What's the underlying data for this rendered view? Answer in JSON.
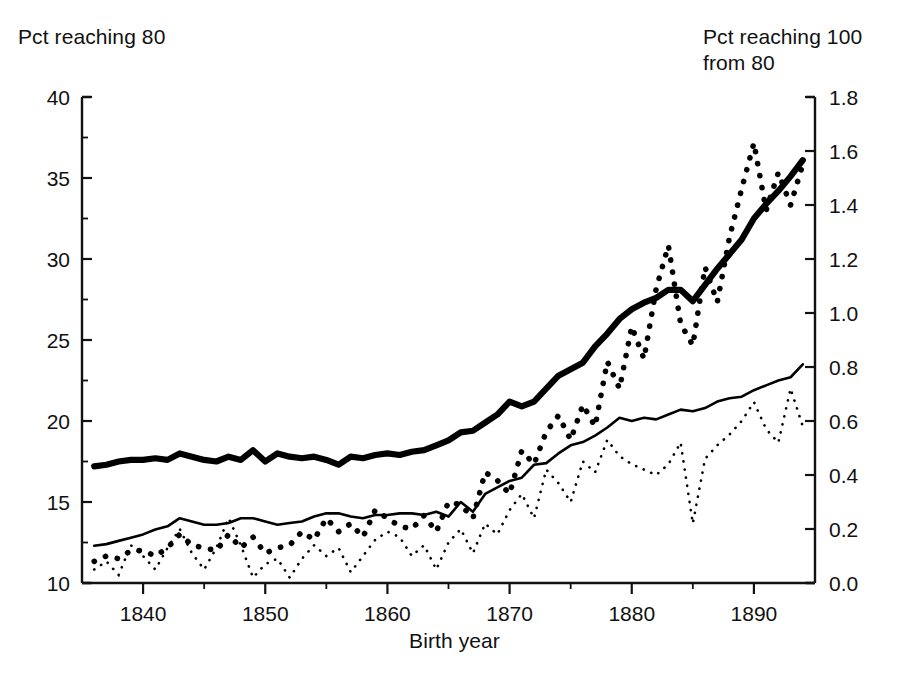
{
  "chart_data": {
    "type": "line",
    "title": "",
    "xlabel": "Birth year",
    "ylabel_left": "Pct reaching 80",
    "ylabel_right": "Pct reaching 100\nfrom 80",
    "grid": false,
    "legend": "none",
    "xlim": [
      1835,
      1895
    ],
    "ylim_left": [
      10,
      40
    ],
    "ylim_right": [
      0.0,
      1.8
    ],
    "xticks": [
      1840,
      1850,
      1860,
      1870,
      1880,
      1890
    ],
    "xticklabels": [
      "1840",
      "1850",
      "1860",
      "1870",
      "1880",
      "1890"
    ],
    "xticks_minor": [
      1845,
      1855,
      1865,
      1875,
      1885
    ],
    "yticks_left": [
      10,
      15,
      20,
      25,
      30,
      35,
      40
    ],
    "yticklabels_left": [
      "10",
      "15",
      "20",
      "25",
      "30",
      "35",
      "40"
    ],
    "yticks_left_minor": [
      12.5,
      17.5,
      22.5,
      27.5,
      32.5,
      37.5
    ],
    "yticks_right": [
      0.0,
      0.2,
      0.4,
      0.6,
      0.8,
      1.0,
      1.2,
      1.4,
      1.6,
      1.8
    ],
    "yticklabels_right": [
      "0.0",
      "0.2",
      "0.4",
      "0.6",
      "0.8",
      "1.0",
      "1.2",
      "1.4",
      "1.6",
      "1.8"
    ],
    "series": [
      {
        "name": "Pct reaching 80, women (thick solid)",
        "style": "thick-solid",
        "axis": "left",
        "x": [
          1836,
          1837,
          1838,
          1839,
          1840,
          1841,
          1842,
          1843,
          1844,
          1845,
          1846,
          1847,
          1848,
          1849,
          1850,
          1851,
          1852,
          1853,
          1854,
          1855,
          1856,
          1857,
          1858,
          1859,
          1860,
          1861,
          1862,
          1863,
          1864,
          1865,
          1866,
          1867,
          1868,
          1869,
          1870,
          1871,
          1872,
          1873,
          1874,
          1875,
          1876,
          1877,
          1878,
          1879,
          1880,
          1881,
          1882,
          1883,
          1884,
          1885,
          1886,
          1887,
          1888,
          1889,
          1890,
          1891,
          1892,
          1893,
          1894
        ],
        "y": [
          17.2,
          17.3,
          17.5,
          17.6,
          17.6,
          17.7,
          17.6,
          18.0,
          17.8,
          17.6,
          17.5,
          17.8,
          17.6,
          18.2,
          17.5,
          18.0,
          17.8,
          17.7,
          17.8,
          17.6,
          17.3,
          17.8,
          17.7,
          17.9,
          18.0,
          17.9,
          18.1,
          18.2,
          18.5,
          18.8,
          19.3,
          19.4,
          19.9,
          20.4,
          21.2,
          20.9,
          21.2,
          22.0,
          22.8,
          23.2,
          23.6,
          24.6,
          25.4,
          26.3,
          26.9,
          27.3,
          27.6,
          28.1,
          28.1,
          27.4,
          28.4,
          29.4,
          30.3,
          31.2,
          32.5,
          33.4,
          34.2,
          35.1,
          36.1
        ]
      },
      {
        "name": "Pct reaching 80, men (thin solid)",
        "style": "thin-solid",
        "axis": "left",
        "x": [
          1836,
          1837,
          1838,
          1839,
          1840,
          1841,
          1842,
          1843,
          1844,
          1845,
          1846,
          1847,
          1848,
          1849,
          1850,
          1851,
          1852,
          1853,
          1854,
          1855,
          1856,
          1857,
          1858,
          1859,
          1860,
          1861,
          1862,
          1863,
          1864,
          1865,
          1866,
          1867,
          1868,
          1869,
          1870,
          1871,
          1872,
          1873,
          1874,
          1875,
          1876,
          1877,
          1878,
          1879,
          1880,
          1881,
          1882,
          1883,
          1884,
          1885,
          1886,
          1887,
          1888,
          1889,
          1890,
          1891,
          1892,
          1893,
          1894
        ],
        "y": [
          12.3,
          12.4,
          12.6,
          12.8,
          13.0,
          13.3,
          13.5,
          14.0,
          13.8,
          13.6,
          13.6,
          13.7,
          14.0,
          14.0,
          13.8,
          13.6,
          13.7,
          13.8,
          14.1,
          14.3,
          14.3,
          14.1,
          14.0,
          14.2,
          14.2,
          14.3,
          14.3,
          14.2,
          14.4,
          14.1,
          15.0,
          14.4,
          15.5,
          15.9,
          16.3,
          16.5,
          17.3,
          17.4,
          18.0,
          18.5,
          18.7,
          19.1,
          19.6,
          20.2,
          20.0,
          20.2,
          20.1,
          20.4,
          20.7,
          20.6,
          20.8,
          21.2,
          21.4,
          21.5,
          21.9,
          22.2,
          22.5,
          22.7,
          23.5
        ]
      },
      {
        "name": "Pct reaching 100 from 80, women (thick dotted)",
        "style": "thick-dotted",
        "axis": "right",
        "x": [
          1836,
          1837,
          1838,
          1839,
          1840,
          1841,
          1842,
          1843,
          1844,
          1845,
          1846,
          1847,
          1848,
          1849,
          1850,
          1851,
          1852,
          1853,
          1854,
          1855,
          1856,
          1857,
          1858,
          1859,
          1860,
          1861,
          1862,
          1863,
          1864,
          1865,
          1866,
          1867,
          1868,
          1869,
          1870,
          1871,
          1872,
          1873,
          1874,
          1875,
          1876,
          1877,
          1878,
          1879,
          1880,
          1881,
          1882,
          1883,
          1884,
          1885,
          1886,
          1887,
          1888,
          1889,
          1890,
          1891,
          1892,
          1893,
          1894
        ],
        "y": [
          0.08,
          0.1,
          0.09,
          0.12,
          0.12,
          0.1,
          0.13,
          0.18,
          0.14,
          0.13,
          0.12,
          0.18,
          0.13,
          0.17,
          0.11,
          0.13,
          0.14,
          0.19,
          0.16,
          0.24,
          0.19,
          0.22,
          0.17,
          0.27,
          0.24,
          0.21,
          0.2,
          0.25,
          0.19,
          0.3,
          0.29,
          0.24,
          0.41,
          0.38,
          0.33,
          0.49,
          0.44,
          0.56,
          0.62,
          0.53,
          0.66,
          0.58,
          0.82,
          0.72,
          0.95,
          0.83,
          1.09,
          1.25,
          0.96,
          0.88,
          1.17,
          1.04,
          1.28,
          1.46,
          1.63,
          1.38,
          1.52,
          1.4,
          1.55
        ]
      },
      {
        "name": "Pct reaching 100 from 80, men (thin dotted)",
        "style": "thin-dotted",
        "axis": "right",
        "x": [
          1836,
          1837,
          1838,
          1839,
          1840,
          1841,
          1842,
          1843,
          1844,
          1845,
          1846,
          1847,
          1848,
          1849,
          1850,
          1851,
          1852,
          1853,
          1854,
          1855,
          1856,
          1857,
          1858,
          1859,
          1860,
          1861,
          1862,
          1863,
          1864,
          1865,
          1866,
          1867,
          1868,
          1869,
          1870,
          1871,
          1872,
          1873,
          1874,
          1875,
          1876,
          1877,
          1878,
          1879,
          1880,
          1881,
          1882,
          1883,
          1884,
          1885,
          1886,
          1887,
          1888,
          1889,
          1890,
          1891,
          1892,
          1893,
          1894
        ],
        "y": [
          0.05,
          0.08,
          0.03,
          0.14,
          0.1,
          0.05,
          0.13,
          0.2,
          0.11,
          0.05,
          0.13,
          0.24,
          0.14,
          0.02,
          0.07,
          0.09,
          0.02,
          0.09,
          0.14,
          0.1,
          0.13,
          0.04,
          0.1,
          0.16,
          0.19,
          0.17,
          0.1,
          0.14,
          0.05,
          0.15,
          0.2,
          0.11,
          0.22,
          0.18,
          0.27,
          0.33,
          0.24,
          0.42,
          0.37,
          0.3,
          0.45,
          0.41,
          0.53,
          0.47,
          0.44,
          0.42,
          0.4,
          0.44,
          0.52,
          0.22,
          0.46,
          0.51,
          0.55,
          0.6,
          0.67,
          0.57,
          0.52,
          0.72,
          0.58
        ]
      }
    ]
  }
}
